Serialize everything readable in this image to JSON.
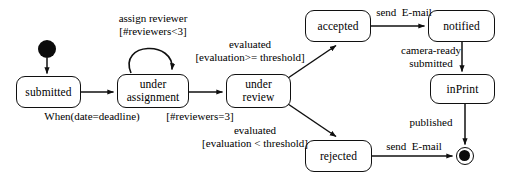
{
  "diagram": {
    "type": "uml-state-diagram",
    "stroke_color": "#101010",
    "fill_color": "#ffffff"
  },
  "states": [
    {
      "id": "submitted",
      "label": "submitted",
      "x": 16,
      "y": 76,
      "w": 65,
      "h": 32
    },
    {
      "id": "under_assignment",
      "label": "under\nassignment",
      "x": 117,
      "y": 74,
      "w": 72,
      "h": 34
    },
    {
      "id": "under_review",
      "label": "under\nreview",
      "x": 226,
      "y": 74,
      "w": 65,
      "h": 34
    },
    {
      "id": "accepted",
      "label": "accepted",
      "x": 305,
      "y": 10,
      "w": 66,
      "h": 32
    },
    {
      "id": "notified",
      "label": "notified",
      "x": 428,
      "y": 10,
      "w": 67,
      "h": 32
    },
    {
      "id": "inprint",
      "label": "inPrint",
      "x": 430,
      "y": 74,
      "w": 65,
      "h": 30
    },
    {
      "id": "rejected",
      "label": "rejected",
      "x": 305,
      "y": 140,
      "w": 67,
      "h": 32
    }
  ],
  "pseudostates": {
    "initial": {
      "name": "initial-state",
      "cx": 47,
      "cy": 49,
      "r": 9
    },
    "final": {
      "name": "final-state",
      "cx": 465,
      "cy": 156,
      "outer_r": 9,
      "inner_r": 6
    }
  },
  "transitions": [
    {
      "id": "t_start",
      "from": "initial",
      "to": "submitted",
      "label": ""
    },
    {
      "id": "t_deadline",
      "from": "submitted",
      "to": "under_assignment",
      "label": "When(date=deadline)"
    },
    {
      "id": "t_assign",
      "from": "under_assignment",
      "to": "under_assignment",
      "label": "assign reviewer\n[#reviewers<3]"
    },
    {
      "id": "t_toreview",
      "from": "under_assignment",
      "to": "under_review",
      "label": "[#reviewers=3]"
    },
    {
      "id": "t_accept",
      "from": "under_review",
      "to": "accepted",
      "label": "evaluated\n[evaluation>= threshold]"
    },
    {
      "id": "t_reject",
      "from": "under_review",
      "to": "rejected",
      "label": "evaluated\n[evaluation < threshold]"
    },
    {
      "id": "t_notify",
      "from": "accepted",
      "to": "notified",
      "label": "send  E-mail"
    },
    {
      "id": "t_cameraready",
      "from": "notified",
      "to": "inprint",
      "label": "camera-ready\nsubmitted"
    },
    {
      "id": "t_published",
      "from": "inprint",
      "to": "final",
      "label": "published"
    },
    {
      "id": "t_rejectmail",
      "from": "rejected",
      "to": "final",
      "label": "send  E-mail"
    }
  ],
  "labels": {
    "assign_reviewer_line1": "assign reviewer",
    "assign_reviewer_line2": "[#reviewers<3]",
    "when_deadline": "When(date=deadline)",
    "reviewers_eq_3": "[#reviewers=3]",
    "evaluated_accept_line1": "evaluated",
    "evaluated_accept_line2": "[evaluation>= threshold]",
    "evaluated_reject_line1": "evaluated",
    "evaluated_reject_line2": "[evaluation < threshold]",
    "send_email_top": "send  E-mail",
    "camera_ready_line1": "camera-ready",
    "camera_ready_line2": "submitted",
    "published": "published",
    "send_email_bottom": "send  E-mail"
  }
}
